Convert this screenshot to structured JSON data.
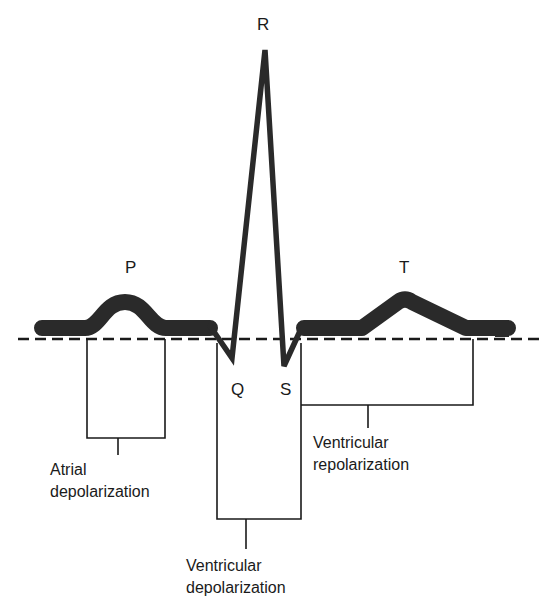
{
  "diagram": {
    "colors": {
      "trace": "#2a2a2a",
      "lines": "#1a1a1a",
      "background": "#ffffff"
    },
    "waves": {
      "P": "P",
      "Q": "Q",
      "R": "R",
      "S": "S",
      "T": "T"
    },
    "phases": {
      "atrial_depolarization": {
        "line1": "Atrial",
        "line2": "depolarization"
      },
      "ventricular_depolarization": {
        "line1": "Ventricular",
        "line2": "depolarization"
      },
      "ventricular_repolarization": {
        "line1": "Ventricular",
        "line2": "repolarization"
      }
    }
  }
}
